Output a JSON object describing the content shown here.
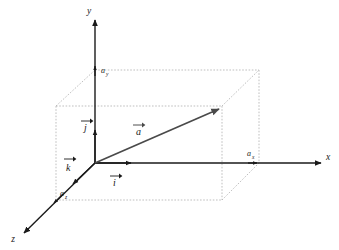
{
  "figure": {
    "type": "3d-vector-decomposition-diagram",
    "background_color": "#ffffff"
  },
  "colors": {
    "axis": "#1a1a1a",
    "vector": "#4a4a4a",
    "box": "#b8b8b8",
    "label": "#1a1a1a"
  },
  "axes": [
    {
      "key": "x",
      "label": "x",
      "direction": "right"
    },
    {
      "key": "y",
      "label": "y",
      "direction": "up"
    },
    {
      "key": "z",
      "label": "z",
      "direction": "down-left"
    }
  ],
  "unit_vectors": [
    {
      "key": "i",
      "label": "i",
      "axis": "x",
      "accent": "arrow"
    },
    {
      "key": "j",
      "label": "j",
      "axis": "y",
      "accent": "arrow"
    },
    {
      "key": "k",
      "label": "k",
      "axis": "z",
      "accent": "arrow"
    }
  ],
  "vector": {
    "label": "a",
    "accent": "arrow",
    "color": "#4a4a4a"
  },
  "components": [
    {
      "key": "ax",
      "base": "a",
      "subscript": "x",
      "axis": "x"
    },
    {
      "key": "ay",
      "base": "a",
      "subscript": "y",
      "axis": "y"
    },
    {
      "key": "az",
      "base": "a",
      "subscript": "z",
      "axis": "z"
    }
  ],
  "geometry": {
    "origin": {
      "x": 95,
      "y": 163
    },
    "x_axis_end": {
      "x": 325,
      "y": 163
    },
    "y_axis_end": {
      "x": 95,
      "y": 16
    },
    "z_axis_end": {
      "x": 20,
      "y": 237
    },
    "vector_tip": {
      "x": 223,
      "y": 106
    },
    "ax_point": {
      "x": 254,
      "y": 163
    },
    "ay_point": {
      "x": 95,
      "y": 70
    },
    "az_point": {
      "x": 56,
      "y": 200
    },
    "box_front_bottom_left": {
      "x": 56,
      "y": 200
    },
    "box_front_bottom_right": {
      "x": 222,
      "y": 200
    },
    "box_front_top_left": {
      "x": 56,
      "y": 106
    },
    "box_front_top_right": {
      "x": 222,
      "y": 106
    },
    "box_back_top_left": {
      "x": 95,
      "y": 70
    },
    "box_back_top_right": {
      "x": 259,
      "y": 70
    },
    "box_back_bottom_right": {
      "x": 259,
      "y": 163
    }
  }
}
